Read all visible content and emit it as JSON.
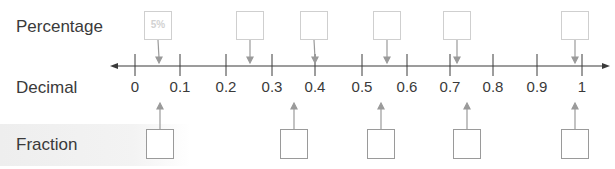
{
  "labels": {
    "percentage": "Percentage",
    "decimal": "Decimal",
    "fraction": "Fraction"
  },
  "number_line": {
    "ticks": [
      "0",
      "0.1",
      "0.2",
      "0.3",
      "0.4",
      "0.5",
      "0.6",
      "0.7",
      "0.8",
      "0.9",
      "1"
    ],
    "tick_x": [
      135,
      180,
      226,
      272,
      315,
      362,
      407,
      450,
      493,
      537,
      582
    ],
    "line_color": "#3a3a3a"
  },
  "percentage_boxes": [
    {
      "value": "5%",
      "x": 158,
      "arrow_x": 159
    },
    {
      "value": "",
      "x": 250,
      "arrow_x": 250
    },
    {
      "value": "",
      "x": 314,
      "arrow_x": 315
    },
    {
      "value": "",
      "x": 387,
      "arrow_x": 387
    },
    {
      "value": "",
      "x": 457,
      "arrow_x": 457
    },
    {
      "value": "",
      "x": 575,
      "arrow_x": 575
    }
  ],
  "fraction_boxes": [
    {
      "value": "",
      "x": 160
    },
    {
      "value": "",
      "x": 294
    },
    {
      "value": "",
      "x": 381
    },
    {
      "value": "",
      "x": 467
    },
    {
      "value": "",
      "x": 575
    }
  ],
  "colors": {
    "percentage_box_border": "#cfcfcf",
    "fraction_box_border": "#9a9a9a",
    "arrow": "#9a9a9a"
  }
}
